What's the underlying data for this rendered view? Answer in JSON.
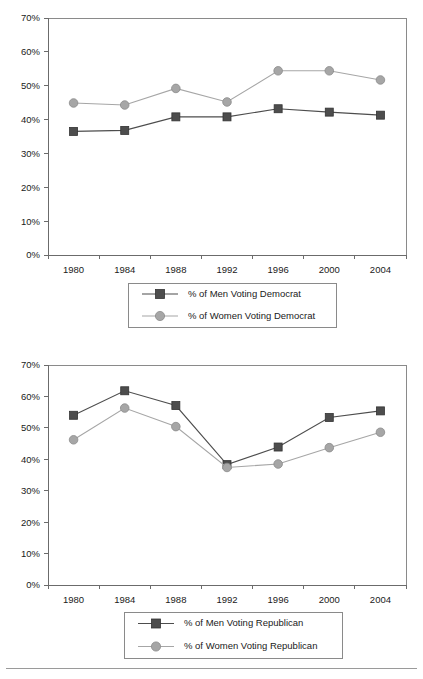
{
  "page": {
    "background": "#ffffff",
    "footer_rule": true
  },
  "style": {
    "men_color": "#4d4d4d",
    "women_color": "#a6a6a6",
    "men_marker": "square",
    "women_marker": "circle",
    "axis_color": "#6b6b6b",
    "border_color": "#8a8a8a",
    "text_color": "#1a1a1a"
  },
  "chart_data": [
    {
      "id": "democrat",
      "type": "line",
      "title": "",
      "xlabel": "",
      "ylabel": "",
      "categories": [
        "1980",
        "1984",
        "1988",
        "1992",
        "1996",
        "2000",
        "2004"
      ],
      "ylim": [
        0,
        70
      ],
      "ytick_labels": [
        "0%",
        "10%",
        "20%",
        "30%",
        "40%",
        "50%",
        "60%",
        "70%"
      ],
      "ytick_values": [
        0,
        10,
        20,
        30,
        40,
        50,
        60,
        70
      ],
      "grid": false,
      "legend_position": "bottom",
      "series": [
        {
          "name": "% of Men Voting Democrat",
          "marker": "square",
          "color": "#4d4d4d",
          "values": [
            36.5,
            36.8,
            40.8,
            40.8,
            43.2,
            42.2,
            41.3
          ]
        },
        {
          "name": "% of Women Voting Democrat",
          "marker": "circle",
          "color": "#a6a6a6",
          "values": [
            44.9,
            44.3,
            49.2,
            45.2,
            54.4,
            54.4,
            51.7
          ]
        }
      ]
    },
    {
      "id": "republican",
      "type": "line",
      "title": "",
      "xlabel": "",
      "ylabel": "",
      "categories": [
        "1980",
        "1984",
        "1988",
        "1992",
        "1996",
        "2000",
        "2004"
      ],
      "ylim": [
        0,
        70
      ],
      "ytick_labels": [
        "0%",
        "10%",
        "20%",
        "30%",
        "40%",
        "50%",
        "60%",
        "70%"
      ],
      "ytick_values": [
        0,
        10,
        20,
        30,
        40,
        50,
        60,
        70
      ],
      "grid": false,
      "legend_position": "bottom",
      "series": [
        {
          "name": "% of Men Voting Republican",
          "marker": "square",
          "color": "#4d4d4d",
          "values": [
            54.0,
            61.8,
            57.1,
            38.3,
            43.9,
            53.3,
            55.4
          ]
        },
        {
          "name": "% of Women Voting Republican",
          "marker": "circle",
          "color": "#a6a6a6",
          "values": [
            46.2,
            56.3,
            50.4,
            37.4,
            38.5,
            43.7,
            48.6
          ]
        }
      ]
    }
  ]
}
